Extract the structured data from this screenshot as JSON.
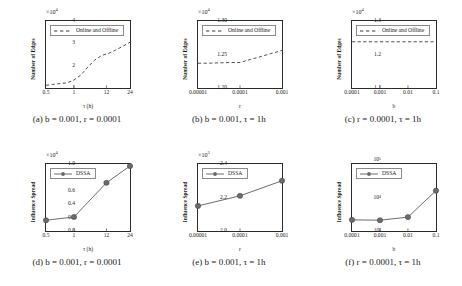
{
  "figure": {
    "panels": [
      {
        "id": "a",
        "caption": "(a) b = 0.001, r = 0.0001",
        "legend_label": "Online and Offline",
        "xlabel": "τ (h)",
        "ylabel": "Number of Edges",
        "multiplier": "×10",
        "multiplier_exp": "4",
        "yticks": [
          "1",
          "2",
          "3",
          "4"
        ],
        "xticks": [
          "0.5",
          "1",
          "12",
          "24"
        ],
        "chart_data": {
          "type": "line",
          "title": "",
          "xlabel": "τ (h)",
          "ylabel": "Number of Edges",
          "x": [
            0.5,
            1,
            12,
            24
          ],
          "xscale": "categorical",
          "ylim": [
            1,
            4
          ],
          "xtick_labels": [
            "0.5",
            "1",
            "12",
            "24"
          ],
          "grid": false,
          "legend_position": "upper left",
          "series": [
            {
              "name": "Online and Offline",
              "style": "dashed",
              "color": "#3a3a3a",
              "values": [
                1.12,
                1.23,
                2.56,
                3.05
              ],
              "dense_x": [
                0.0,
                0.08,
                0.17,
                0.25,
                0.33,
                0.42,
                0.5,
                0.58,
                0.66,
                0.75,
                0.83,
                0.92,
                1.0
              ],
              "dense_y": [
                1.12,
                1.16,
                1.2,
                1.23,
                1.35,
                1.6,
                1.95,
                2.25,
                2.45,
                2.56,
                2.7,
                2.88,
                3.05
              ]
            }
          ]
        }
      },
      {
        "id": "b",
        "caption": "(b) b = 0.001, τ = 1h",
        "legend_label": "Online and Offline",
        "xlabel": "r",
        "ylabel": "Number of Edges",
        "multiplier": "×10",
        "multiplier_exp": "4",
        "yticks": [
          "1.20",
          "1.25",
          "1.30"
        ],
        "xticks": [
          "0.00001",
          "0.0001",
          "0.001"
        ],
        "chart_data": {
          "type": "line",
          "title": "",
          "xlabel": "r",
          "ylabel": "Number of Edges",
          "x": [
            1e-05,
            0.0001,
            0.001
          ],
          "xscale": "categorical",
          "ylim": [
            1.2,
            1.3
          ],
          "xtick_labels": [
            "0.00001",
            "0.0001",
            "0.001"
          ],
          "grid": false,
          "legend_position": "upper left",
          "series": [
            {
              "name": "Online and Offline",
              "style": "dashed",
              "color": "#3a3a3a",
              "values": [
                1.237,
                1.238,
                1.256
              ],
              "dense_x": [
                0.0,
                0.12,
                0.25,
                0.38,
                0.5,
                0.62,
                0.75,
                0.87,
                1.0
              ],
              "dense_y": [
                1.237,
                1.237,
                1.2375,
                1.238,
                1.238,
                1.2425,
                1.247,
                1.2515,
                1.256
              ]
            }
          ]
        }
      },
      {
        "id": "c",
        "caption": "(c) r = 0.0001, τ = 1h",
        "legend_label": "Online and Offline",
        "xlabel": "b",
        "ylabel": "Number of Edges",
        "multiplier": "×10",
        "multiplier_exp": "4",
        "yticks": [
          "1.1",
          "1.2",
          "1.3"
        ],
        "xticks": [
          "0.0001",
          "0.001",
          "0.01",
          "0.1"
        ],
        "chart_data": {
          "type": "line",
          "title": "",
          "xlabel": "b",
          "ylabel": "Number of Edges",
          "x": [
            0.0001,
            0.001,
            0.01,
            0.1
          ],
          "xscale": "categorical",
          "ylim": [
            1.1,
            1.3
          ],
          "xtick_labels": [
            "0.0001",
            "0.001",
            "0.01",
            "0.1"
          ],
          "grid": false,
          "legend_position": "upper left",
          "series": [
            {
              "name": "Online and Offline",
              "style": "dashed",
              "color": "#3a3a3a",
              "values": [
                1.238,
                1.238,
                1.238,
                1.238
              ],
              "dense_x": [
                0.0,
                0.25,
                0.5,
                0.75,
                1.0
              ],
              "dense_y": [
                1.238,
                1.238,
                1.238,
                1.238,
                1.238
              ]
            }
          ]
        }
      },
      {
        "id": "d",
        "caption": "(d) b = 0.001, r = 0.0001",
        "legend_label": "DSSA",
        "xlabel": "τ (h)",
        "ylabel": "Influence Spread",
        "multiplier": "×10",
        "multiplier_exp": "4",
        "yticks": [
          "0.0",
          "0.2",
          "0.4",
          "0.6",
          "0.8",
          "1.0"
        ],
        "xticks": [
          "0.5",
          "1",
          "12",
          "24"
        ],
        "chart_data": {
          "type": "line",
          "title": "",
          "xlabel": "τ (h)",
          "ylabel": "Influence Spread",
          "x": [
            0.5,
            1,
            12,
            24
          ],
          "xscale": "categorical",
          "ylim": [
            0.0,
            1.0
          ],
          "xtick_labels": [
            "0.5",
            "1",
            "12",
            "24"
          ],
          "grid": false,
          "legend_position": "upper left",
          "markers": true,
          "series": [
            {
              "name": "DSSA",
              "style": "solid-marker",
              "color": "#6b6b6b",
              "values": [
                0.16,
                0.21,
                0.72,
                0.97
              ]
            }
          ]
        }
      },
      {
        "id": "e",
        "caption": "(e) b = 0.001, τ = 1h",
        "legend_label": "DSSA",
        "xlabel": "r",
        "ylabel": "Influence Spread",
        "multiplier": "×10",
        "multiplier_exp": "3",
        "yticks": [
          "2.0",
          "2.2",
          "2.4"
        ],
        "xticks": [
          "0.00001",
          "0.0001",
          "0.001"
        ],
        "chart_data": {
          "type": "line",
          "title": "",
          "xlabel": "r",
          "ylabel": "Influence Spread",
          "x": [
            1e-05,
            0.0001,
            0.001
          ],
          "xscale": "categorical",
          "ylim": [
            2.0,
            2.4
          ],
          "xtick_labels": [
            "0.00001",
            "0.0001",
            "0.001"
          ],
          "grid": false,
          "legend_position": "upper left",
          "markers": true,
          "series": [
            {
              "name": "DSSA",
              "style": "solid-marker",
              "color": "#6b6b6b",
              "values": [
                2.15,
                2.21,
                2.3
              ]
            }
          ]
        }
      },
      {
        "id": "f",
        "caption": "(f) r = 0.0001, τ = 1h",
        "legend_label": "DSSA",
        "xlabel": "b",
        "ylabel": "Influence Spread",
        "multiplier": "",
        "multiplier_exp": "",
        "yticks": [
          "10³",
          "10⁴",
          "10⁵"
        ],
        "xticks": [
          "0.0001",
          "0.001",
          "0.01",
          "0.1"
        ],
        "chart_data": {
          "type": "line",
          "title": "",
          "xlabel": "b",
          "ylabel": "Influence Spread",
          "x": [
            0.0001,
            0.001,
            0.01,
            0.1
          ],
          "xscale": "categorical",
          "yscale": "log",
          "ylim": [
            1000,
            100000
          ],
          "ytick_labels": [
            "10^3",
            "10^4",
            "10^5"
          ],
          "xtick_labels": [
            "0.0001",
            "0.001",
            "0.01",
            "0.1"
          ],
          "grid": false,
          "legend_position": "upper left",
          "markers": true,
          "series": [
            {
              "name": "DSSA",
              "style": "solid-marker",
              "color": "#6b6b6b",
              "values": [
                2150,
                2100,
                2600,
                16000
              ]
            }
          ]
        }
      }
    ]
  }
}
